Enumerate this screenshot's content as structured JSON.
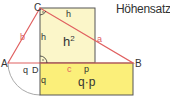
{
  "title": "Höhensatz:",
  "colors": {
    "triangle": "#e06060",
    "square_fill": "#fbf6c9",
    "rect_fill": "#fbef7a",
    "outline": "#555555",
    "arc": "#999999",
    "text": "#333333"
  },
  "labels": {
    "vertex_A": "A",
    "vertex_B": "B",
    "vertex_C": "C",
    "vertex_D": "D",
    "side_a": "a",
    "side_b": "b",
    "side_c": "c",
    "height_top": "h",
    "height_left": "h",
    "square_area": "h",
    "square_exp": "2",
    "segment_q": "q",
    "segment_p": "p",
    "rect_side_q": "q",
    "rect_area": "q·p"
  }
}
